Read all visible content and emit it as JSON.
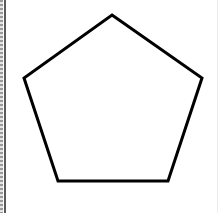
{
  "diagram": {
    "shape": "pentagon",
    "fill": "#ffffff",
    "stroke": "#000000",
    "stroke_width": 3,
    "vertices": [
      [
        112,
        15
      ],
      [
        202,
        78
      ],
      [
        168,
        181
      ],
      [
        58,
        181
      ],
      [
        24,
        78
      ]
    ]
  },
  "frame": {
    "left_border_color": "#5a5a5a",
    "background": "#ffffff"
  }
}
